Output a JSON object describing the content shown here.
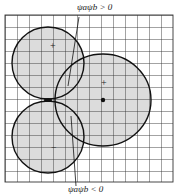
{
  "diagram": {
    "type": "orbital-overlap",
    "labels": {
      "top": "ψaψb > 0",
      "bottom": "ψaψb < 0"
    },
    "lobes": [
      {
        "id": "p-lobe-upper",
        "sign": "+"
      },
      {
        "id": "p-lobe-lower",
        "sign": "−"
      },
      {
        "id": "s-orbital",
        "sign": "+"
      }
    ],
    "colors": {
      "fill": "#dcdcdc",
      "grid": "#333333",
      "outline": "#111111"
    }
  }
}
